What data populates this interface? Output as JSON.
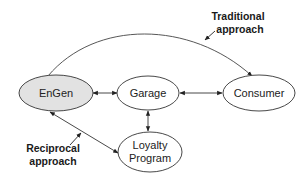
{
  "diagram": {
    "nodes": [
      {
        "id": "engen",
        "label": "EnGen",
        "fill": "#e2e2e2"
      },
      {
        "id": "garage",
        "label": "Garage",
        "fill": "#ffffff"
      },
      {
        "id": "consumer",
        "label": "Consumer",
        "fill": "#ffffff"
      },
      {
        "id": "loyalty",
        "label_lines": [
          "Loyalty",
          "Program"
        ],
        "fill": "#ffffff"
      }
    ],
    "edges": [
      {
        "from": "engen",
        "to": "consumer",
        "type": "curved",
        "direction": "to-consumer"
      },
      {
        "from": "engen",
        "to": "garage",
        "type": "straight",
        "direction": "both"
      },
      {
        "from": "garage",
        "to": "consumer",
        "type": "straight",
        "direction": "both"
      },
      {
        "from": "garage",
        "to": "loyalty",
        "type": "straight",
        "direction": "both"
      },
      {
        "from": "engen",
        "to": "loyalty",
        "type": "straight",
        "direction": "both"
      }
    ],
    "annotations": {
      "traditional": {
        "lines": [
          "Traditional",
          "approach"
        ],
        "points_to": "curved edge engen-consumer"
      },
      "reciprocal": {
        "lines": [
          "Reciprocal",
          "approach"
        ],
        "points_to": "edge engen-loyalty"
      }
    },
    "colors": {
      "stroke": "#333333",
      "text": "#222222"
    }
  }
}
